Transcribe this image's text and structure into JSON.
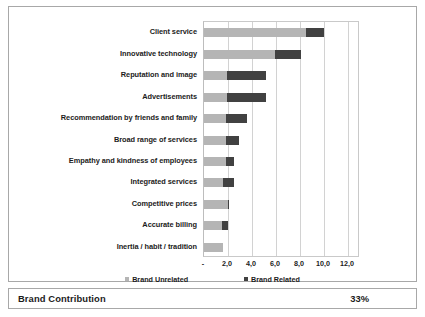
{
  "chart_data": {
    "type": "bar",
    "orientation": "horizontal",
    "stacked": true,
    "title": "",
    "xlabel": "",
    "ylabel": "",
    "xlim": [
      0,
      13.0
    ],
    "grid": true,
    "legend_position": "bottom",
    "xticks": [
      "-",
      "2,0",
      "4,0",
      "6,0",
      "8,0",
      "10,0",
      "12,0"
    ],
    "xtick_values": [
      0,
      2.0,
      4.0,
      6.0,
      8.0,
      10.0,
      12.0
    ],
    "categories": [
      "Client service",
      "Innovative technology",
      "Reputation and image",
      "Advertisements",
      "Recommendation by friends and family",
      "Broad range of services",
      "Empathy and kindness of employees",
      "Integrated services",
      "Competitive prices",
      "Accurate billing",
      "Inertia / habit / tradition"
    ],
    "series": [
      {
        "name": "Brand Unrelated",
        "color": "#b5b5b5",
        "values": [
          8.5,
          5.9,
          1.9,
          1.9,
          1.8,
          1.8,
          1.8,
          1.6,
          2.0,
          1.5,
          1.6
        ]
      },
      {
        "name": "Brand Related",
        "color": "#414141",
        "values": [
          1.5,
          2.2,
          3.3,
          3.3,
          1.8,
          1.1,
          0.7,
          0.9,
          0.1,
          0.5,
          0.0
        ]
      }
    ],
    "totals": [
      10.0,
      8.1,
      5.2,
      5.2,
      3.6,
      2.9,
      2.5,
      2.5,
      2.1,
      2.0,
      1.6
    ]
  },
  "legend": {
    "items": [
      {
        "label": "Brand Unrelated",
        "swatch": "light"
      },
      {
        "label": "Brand Related",
        "swatch": "dark"
      }
    ]
  },
  "footer": {
    "label": "Brand Contribution",
    "value": "33%"
  }
}
